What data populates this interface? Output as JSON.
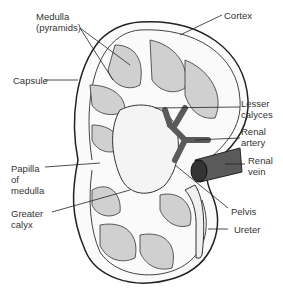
{
  "diagram": {
    "labels": {
      "medulla": "Medulla\n(pyramids)",
      "cortex": "Cortex",
      "capsule": "Capsule",
      "lesser_calyces": "Lesser\ncalyces",
      "renal_artery": "Renal\nartery",
      "renal_vein": "Renal\nvein",
      "papilla": "Papilla\nof\nmedulla",
      "greater_calyx": "Greater\ncalyx",
      "pelvis": "Pelvis",
      "ureter": "Ureter"
    },
    "colors": {
      "outline": "#222222",
      "vessel": "#5a5a5a",
      "pyramid": "#bdbdbd",
      "background": "#ffffff"
    }
  }
}
